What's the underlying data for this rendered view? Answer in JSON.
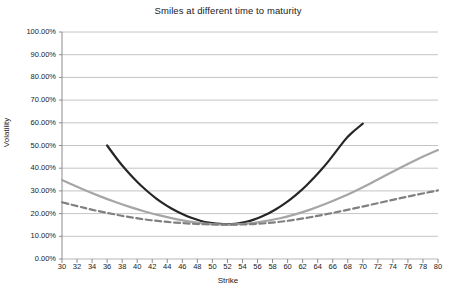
{
  "chart_data": {
    "type": "line",
    "title": "Smiles at different time to maturity",
    "xlabel": "Strike",
    "ylabel": "Volatility",
    "xlim": [
      30,
      80
    ],
    "ylim": [
      0,
      100
    ],
    "grid": true,
    "legend": "none",
    "x_tick_labels": [
      "30",
      "32",
      "34",
      "36",
      "38",
      "40",
      "42",
      "44",
      "46",
      "48",
      "50",
      "52",
      "54",
      "56",
      "58",
      "60",
      "62",
      "64",
      "66",
      "68",
      "70",
      "72",
      "74",
      "76",
      "78",
      "80"
    ],
    "y_tick_labels": [
      "0.00%",
      "10.00%",
      "20.00%",
      "30.00%",
      "40.00%",
      "50.00%",
      "60.00%",
      "70.00%",
      "80.00%",
      "90.00%",
      "100.00%"
    ],
    "y_tick_values": [
      0,
      10,
      20,
      30,
      40,
      50,
      60,
      70,
      80,
      90,
      100
    ],
    "series": [
      {
        "name": "short-maturity-smile",
        "style": "solid",
        "color": "#262626",
        "width": 2.2,
        "x": [
          36,
          37,
          38,
          39,
          40,
          41,
          42,
          43,
          44,
          45,
          46,
          47,
          48,
          49,
          50,
          51,
          52,
          53,
          54,
          55,
          56,
          57,
          58,
          59,
          60,
          61,
          62,
          63,
          64,
          65,
          66,
          67,
          68,
          69,
          70
        ],
        "y": [
          50.0,
          45.4,
          41.2,
          37.4,
          33.9,
          30.8,
          28.0,
          25.5,
          23.3,
          21.4,
          19.8,
          18.4,
          17.2,
          16.3,
          15.7,
          15.4,
          15.3,
          15.5,
          16.0,
          16.8,
          17.9,
          19.3,
          21.0,
          23.0,
          25.3,
          27.9,
          30.8,
          34.0,
          37.5,
          41.3,
          45.4,
          49.8,
          54.0,
          56.9,
          59.6
        ]
      },
      {
        "name": "medium-maturity-smile",
        "style": "solid",
        "color": "#a6a6a6",
        "width": 2.2,
        "x": [
          30,
          32,
          34,
          36,
          38,
          40,
          42,
          44,
          46,
          48,
          50,
          52,
          54,
          56,
          58,
          60,
          62,
          64,
          66,
          68,
          70,
          72,
          74,
          76,
          78,
          80
        ],
        "y": [
          34.8,
          31.8,
          29.0,
          26.4,
          24.0,
          21.9,
          20.0,
          18.4,
          17.0,
          15.9,
          15.3,
          15.1,
          15.4,
          16.1,
          17.2,
          18.7,
          20.6,
          22.9,
          25.5,
          28.4,
          31.6,
          35.0,
          38.5,
          41.9,
          45.1,
          48.0
        ]
      },
      {
        "name": "long-maturity-smile",
        "style": "dashed",
        "color": "#808080",
        "width": 2.2,
        "x": [
          30,
          32,
          34,
          36,
          38,
          40,
          42,
          44,
          46,
          48,
          50,
          52,
          54,
          56,
          58,
          60,
          62,
          64,
          66,
          68,
          70,
          72,
          74,
          76,
          78,
          80
        ],
        "y": [
          25.0,
          23.3,
          21.7,
          20.3,
          19.0,
          17.9,
          17.0,
          16.3,
          15.8,
          15.4,
          15.2,
          15.1,
          15.2,
          15.5,
          16.0,
          16.8,
          17.8,
          19.0,
          20.3,
          21.7,
          23.1,
          24.6,
          26.1,
          27.5,
          28.9,
          30.2
        ]
      }
    ],
    "colors": {
      "grid": "#b5b5b5",
      "axis": "#8c8c8c",
      "text": "#1a1a1a",
      "background": "#ffffff"
    }
  }
}
